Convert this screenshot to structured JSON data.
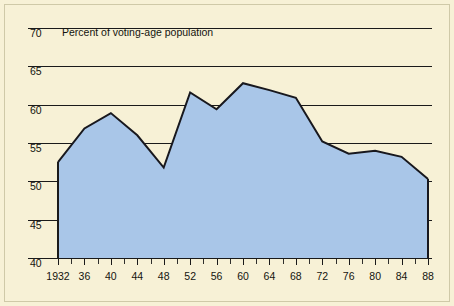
{
  "chart_data": {
    "type": "area",
    "title": "Percent of voting-age population",
    "xlabel": "",
    "ylabel": "",
    "x": [
      1932,
      1936,
      1940,
      1944,
      1948,
      1952,
      1956,
      1960,
      1964,
      1968,
      1972,
      1976,
      1980,
      1984,
      1988
    ],
    "values": [
      52.5,
      56.9,
      58.9,
      56.0,
      51.8,
      61.6,
      59.4,
      62.8,
      61.9,
      60.9,
      55.2,
      53.6,
      54.0,
      53.2,
      50.3
    ],
    "categories": [
      "1932",
      "36",
      "40",
      "44",
      "48",
      "52",
      "56",
      "60",
      "64",
      "68",
      "72",
      "76",
      "80",
      "84",
      "88"
    ],
    "x_tick_labels": [
      "1932",
      "36",
      "40",
      "44",
      "48",
      "52",
      "56",
      "60",
      "64",
      "68",
      "72",
      "76",
      "80",
      "84",
      "88"
    ],
    "y_tick_labels": [
      "40",
      "45",
      "50",
      "55",
      "60",
      "65",
      "70"
    ],
    "y_ticks": [
      40,
      45,
      50,
      55,
      60,
      65,
      70
    ],
    "ylim": [
      40,
      70
    ],
    "xlim": [
      1932,
      1988
    ],
    "grid": true,
    "minor_x_ticks": true,
    "legend": "none",
    "colors": {
      "background": "#f7f1d6",
      "area_fill": "#a9c6e8",
      "line": "#18181e",
      "gridline": "#1a1a1a",
      "text": "#14140f",
      "border": "#cfc9a8"
    }
  }
}
